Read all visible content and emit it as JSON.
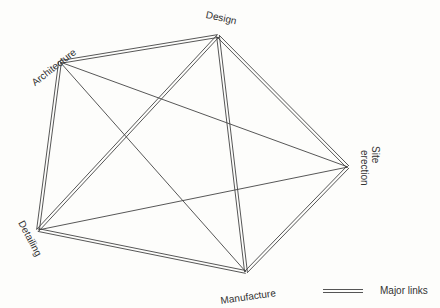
{
  "diagram": {
    "nodes": [
      {
        "id": "architecture",
        "label": "Architecture",
        "x": 60,
        "y": 62
      },
      {
        "id": "design",
        "label": "Design",
        "x": 218,
        "y": 36
      },
      {
        "id": "site",
        "label": "Site erection",
        "label_line1": "Site",
        "label_line2": "erection",
        "x": 348,
        "y": 167
      },
      {
        "id": "manufacture",
        "label": "Manufacture",
        "x": 246,
        "y": 272
      },
      {
        "id": "detailing",
        "label": "Detailing",
        "x": 38,
        "y": 230
      }
    ],
    "links": [
      {
        "from": "architecture",
        "to": "design",
        "type": "major"
      },
      {
        "from": "architecture",
        "to": "detailing",
        "type": "major"
      },
      {
        "from": "architecture",
        "to": "manufacture",
        "type": "minor"
      },
      {
        "from": "architecture",
        "to": "site",
        "type": "minor"
      },
      {
        "from": "design",
        "to": "detailing",
        "type": "major"
      },
      {
        "from": "design",
        "to": "manufacture",
        "type": "major"
      },
      {
        "from": "design",
        "to": "site",
        "type": "major"
      },
      {
        "from": "site",
        "to": "detailing",
        "type": "minor"
      },
      {
        "from": "site",
        "to": "manufacture",
        "type": "major"
      },
      {
        "from": "detailing",
        "to": "manufacture",
        "type": "major"
      }
    ]
  },
  "legend": {
    "major_label": "Major links"
  },
  "colors": {
    "line": "#444444",
    "text": "#333333"
  }
}
